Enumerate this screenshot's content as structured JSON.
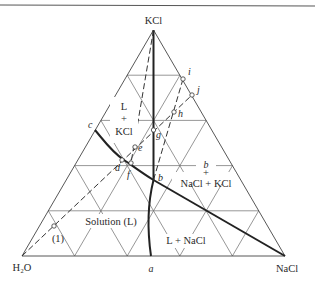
{
  "diagram": {
    "type": "ternary-phase-diagram",
    "vertices": {
      "top": "KCl",
      "left": "H₂O",
      "right": "NaCl"
    },
    "regions": {
      "l_kcl": [
        "L",
        "+",
        "KCl"
      ],
      "b_nacl_kcl": [
        "b",
        "+",
        "NaCl + KCl"
      ],
      "solution": "Solution (L)",
      "l_nacl": "L + NaCl"
    },
    "points": {
      "a": "a",
      "b": "b",
      "c": "c",
      "d": "d",
      "e": "e",
      "f": "f",
      "g": "g",
      "h": "h",
      "i": "i",
      "j": "j",
      "one": "(1)"
    },
    "colors": {
      "line": "#222222",
      "grid": "#6a6a6a",
      "background": "#ffffff"
    }
  }
}
